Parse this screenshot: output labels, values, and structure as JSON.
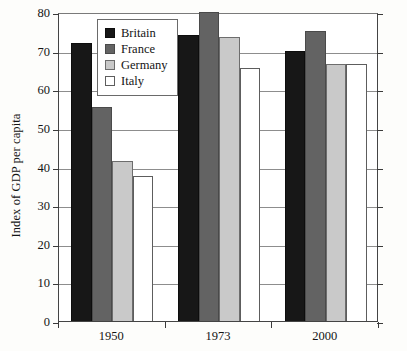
{
  "chart_data": {
    "type": "bar",
    "title": "",
    "xlabel": "",
    "ylabel": "Index of GDP per capita",
    "categories": [
      "1950",
      "1973",
      "2000"
    ],
    "series": [
      {
        "name": "Britain",
        "color": "#171717",
        "values": [
          72,
          74,
          70
        ]
      },
      {
        "name": "France",
        "color": "#636363",
        "values": [
          55.5,
          80,
          75
        ]
      },
      {
        "name": "Germany",
        "color": "#c9c9c9",
        "values": [
          41.5,
          73.5,
          66.5
        ]
      },
      {
        "name": "Italy",
        "color": "#ffffff",
        "values": [
          37.5,
          65.5,
          66.5
        ]
      }
    ],
    "ylim": [
      0,
      80
    ],
    "ytick_values": [
      0,
      10,
      20,
      30,
      40,
      50,
      60,
      70,
      80
    ],
    "ytick_labels": [
      "0",
      "10",
      "20",
      "30",
      "40",
      "50",
      "60",
      "70",
      "80"
    ],
    "grid": true,
    "legend_position": "upper-left-inside",
    "legend_entries": [
      "Britain",
      "France",
      "Germany",
      "Italy"
    ]
  }
}
